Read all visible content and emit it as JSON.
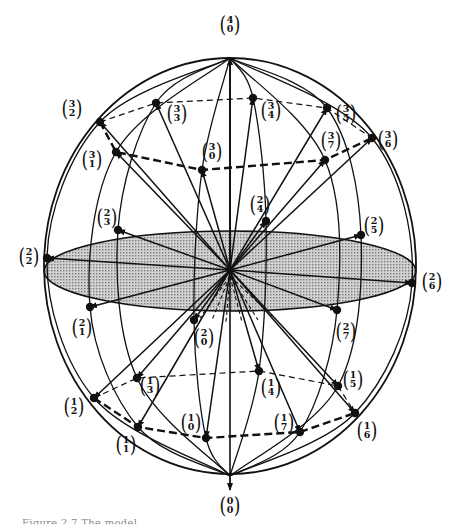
{
  "figure": {
    "caption_partial": "Figure 2.7 The model",
    "colors": {
      "ink": "#111111",
      "disc_fill": "#b9b9b9",
      "background": "#ffffff"
    },
    "center": [
      230,
      270
    ],
    "sphere": {
      "cx": 230,
      "cy": 266,
      "rx": 186,
      "ry": 208
    },
    "equator_disc": {
      "cx": 230,
      "cy": 271,
      "rx": 186,
      "ry": 40
    },
    "poles": {
      "top": {
        "label_top": "4",
        "label_bottom": "0",
        "point": [
          230,
          58
        ],
        "label_pos": [
          230,
          24
        ]
      },
      "bottom": {
        "label_top": "0",
        "label_bottom": "0",
        "point": [
          230,
          476
        ],
        "label_pos": [
          230,
          505
        ]
      }
    },
    "nodes": [
      {
        "id": "3-2",
        "top": "3",
        "bottom": "2",
        "x": 100,
        "y": 122,
        "lx": 72,
        "ly": 108
      },
      {
        "id": "3-3",
        "top": "3",
        "bottom": "3",
        "x": 156,
        "y": 103,
        "lx": 177,
        "ly": 113
      },
      {
        "id": "3-1",
        "top": "3",
        "bottom": "1",
        "x": 116,
        "y": 152,
        "lx": 92,
        "ly": 159
      },
      {
        "id": "3-0",
        "top": "3",
        "bottom": "0",
        "x": 202,
        "y": 170,
        "lx": 212,
        "ly": 151
      },
      {
        "id": "3-4",
        "top": "3",
        "bottom": "4",
        "x": 253,
        "y": 98,
        "lx": 271,
        "ly": 110
      },
      {
        "id": "3-5",
        "top": "3",
        "bottom": "5",
        "x": 327,
        "y": 108,
        "lx": 346,
        "ly": 113
      },
      {
        "id": "3-7",
        "top": "3",
        "bottom": "7",
        "x": 325,
        "y": 160,
        "lx": 331,
        "ly": 140
      },
      {
        "id": "3-6",
        "top": "3",
        "bottom": "6",
        "x": 372,
        "y": 138,
        "lx": 388,
        "ly": 139
      },
      {
        "id": "2-2",
        "top": "2",
        "bottom": "2",
        "x": 47,
        "y": 258,
        "lx": 29,
        "ly": 256
      },
      {
        "id": "2-3",
        "top": "2",
        "bottom": "3",
        "x": 118,
        "y": 230,
        "lx": 107,
        "ly": 217
      },
      {
        "id": "2-1",
        "top": "2",
        "bottom": "1",
        "x": 90,
        "y": 307,
        "lx": 82,
        "ly": 327
      },
      {
        "id": "2-0",
        "top": "2",
        "bottom": "0",
        "x": 194,
        "y": 320,
        "lx": 204,
        "ly": 337
      },
      {
        "id": "2-4",
        "top": "2",
        "bottom": "4",
        "x": 266,
        "y": 221,
        "lx": 260,
        "ly": 204
      },
      {
        "id": "2-5",
        "top": "2",
        "bottom": "5",
        "x": 361,
        "y": 235,
        "lx": 374,
        "ly": 225
      },
      {
        "id": "2-7",
        "top": "2",
        "bottom": "7",
        "x": 337,
        "y": 310,
        "lx": 346,
        "ly": 331
      },
      {
        "id": "2-6",
        "top": "2",
        "bottom": "6",
        "x": 412,
        "y": 283,
        "lx": 432,
        "ly": 281
      },
      {
        "id": "1-2",
        "top": "1",
        "bottom": "2",
        "x": 94,
        "y": 398,
        "lx": 74,
        "ly": 406
      },
      {
        "id": "1-3",
        "top": "1",
        "bottom": "3",
        "x": 137,
        "y": 378,
        "lx": 150,
        "ly": 385
      },
      {
        "id": "1-1",
        "top": "1",
        "bottom": "1",
        "x": 138,
        "y": 427,
        "lx": 126,
        "ly": 444
      },
      {
        "id": "1-0",
        "top": "1",
        "bottom": "0",
        "x": 206,
        "y": 438,
        "lx": 191,
        "ly": 422
      },
      {
        "id": "1-4",
        "top": "1",
        "bottom": "4",
        "x": 259,
        "y": 371,
        "lx": 271,
        "ly": 387
      },
      {
        "id": "1-5",
        "top": "1",
        "bottom": "5",
        "x": 338,
        "y": 386,
        "lx": 353,
        "ly": 379
      },
      {
        "id": "1-7",
        "top": "1",
        "bottom": "7",
        "x": 300,
        "y": 432,
        "lx": 284,
        "ly": 422
      },
      {
        "id": "1-6",
        "top": "1",
        "bottom": "6",
        "x": 355,
        "y": 413,
        "lx": 367,
        "ly": 430
      }
    ]
  }
}
